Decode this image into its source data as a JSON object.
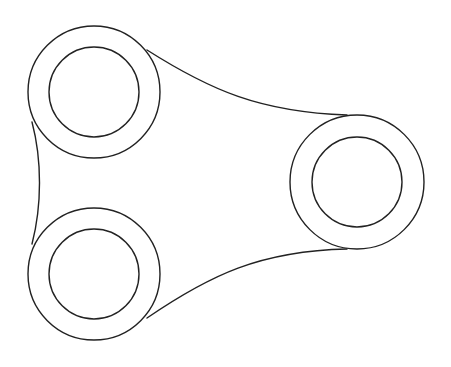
{
  "diagram": {
    "type": "mechanical-link-outline",
    "stroke_color": "#222222",
    "background": "#ffffff",
    "bosses": [
      {
        "id": "top-left",
        "cx": 94,
        "cy": 92,
        "outer_r": 66,
        "inner_r": 45
      },
      {
        "id": "bottom-left",
        "cx": 94,
        "cy": 274,
        "outer_r": 66,
        "inner_r": 45
      },
      {
        "id": "right",
        "cx": 357,
        "cy": 182,
        "outer_r": 67,
        "inner_r": 45
      }
    ],
    "connectors": [
      {
        "id": "top-web",
        "path": "M147,50 C210,90 260,112 347,115"
      },
      {
        "id": "bottom-web",
        "path": "M147,318 C210,275 260,251 347,249"
      },
      {
        "id": "left-web",
        "path": "M32,122 C42,160 42,205 32,244"
      }
    ]
  }
}
